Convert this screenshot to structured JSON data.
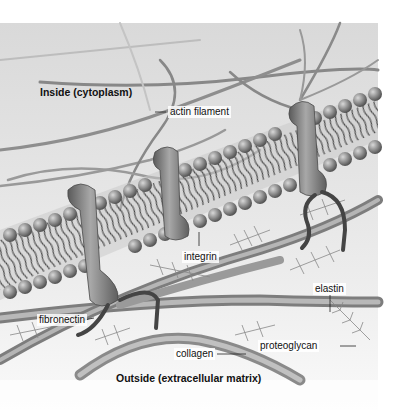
{
  "figure": {
    "regions": {
      "inside": "Inside (cytoplasm)",
      "outside": "Outside (extracellular matrix)"
    },
    "labels": {
      "actin": "actin filament",
      "integrin": "integrin",
      "elastin": "elastin",
      "fibronectin": "fibronectin",
      "proteoglycan": "proteoglycan",
      "collagen": "collagen"
    },
    "colors": {
      "background": "#e4e4e4",
      "membrane_head": "#8a8a8a",
      "protein": "#7a7a7a",
      "fiber": "#8c8c8c",
      "ecm": "#f2f2f2"
    }
  }
}
